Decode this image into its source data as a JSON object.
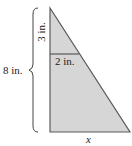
{
  "diagram": {
    "type": "similar-triangles",
    "labels": {
      "total_height": "8 in.",
      "top_segment": "3 in.",
      "inner_width": "2 in.",
      "base": "x"
    },
    "colors": {
      "fill": "#d4d4d4",
      "stroke": "#5a5a5a",
      "text": "#222222"
    }
  }
}
